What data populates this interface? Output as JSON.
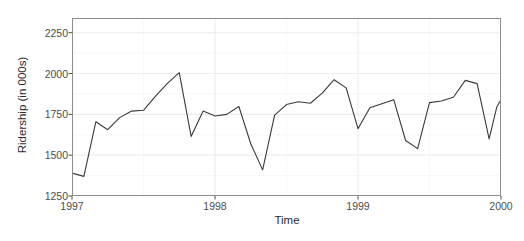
{
  "chart_data": {
    "type": "line",
    "title": "",
    "subtitle": "",
    "xlabel": "Time",
    "ylabel": "Ridership (in 000s)",
    "xlim": [
      1997.0,
      2000.0
    ],
    "ylim": [
      1250,
      2340
    ],
    "x_ticks": [
      1997,
      1998,
      1999,
      2000
    ],
    "x_tick_labels": [
      "1997",
      "1998",
      "1999",
      "2000"
    ],
    "y_ticks": [
      1250,
      1500,
      1750,
      2000,
      2250
    ],
    "y_tick_labels": [
      "1250",
      "1500",
      "1750",
      "2000",
      "2250"
    ],
    "grid": true,
    "minor_grid": true,
    "legend": "none",
    "line_color": "#3a3a3a",
    "panel_background": "#ffffff",
    "panel_border_color": "#808080",
    "grid_color": "#ededed",
    "series": [
      {
        "name": "Ridership",
        "x": [
          1997.0,
          1997.083,
          1997.167,
          1997.25,
          1997.333,
          1997.417,
          1997.5,
          1997.583,
          1997.667,
          1997.75,
          1997.833,
          1997.917,
          1998.0,
          1998.083,
          1998.167,
          1998.25,
          1998.333,
          1998.417,
          1998.5,
          1998.583,
          1998.667,
          1998.75,
          1998.833,
          1998.917,
          1999.0,
          1999.083,
          1999.167,
          1999.25,
          1999.333,
          1999.417,
          1999.5,
          1999.583,
          1999.667,
          1999.75,
          1999.833,
          1999.917
        ],
        "values": [
          1390,
          1370,
          1705,
          1656,
          1730,
          1770,
          1775,
          1860,
          1940,
          2005,
          1615,
          1700,
          1770,
          1740,
          1750,
          1798,
          1570,
          1410,
          1745,
          1810,
          1827,
          1818,
          1880,
          1962,
          1912,
          1662,
          1790,
          1815,
          1840,
          1590,
          1540,
          1822,
          1832,
          1855,
          1958,
          1938
        ],
        "tail_x": [
          1999.917,
          1999.95,
          1999.983
        ],
        "tail_values": [
          1938,
          1600,
          1793
        ]
      }
    ],
    "points_full": [
      {
        "t": "1997-01",
        "x": 1997.0,
        "y": 1390
      },
      {
        "t": "1997-02",
        "x": 1997.083,
        "y": 1370
      },
      {
        "t": "1997-03",
        "x": 1997.167,
        "y": 1705
      },
      {
        "t": "1997-04",
        "x": 1997.25,
        "y": 1656
      },
      {
        "t": "1997-05",
        "x": 1997.333,
        "y": 1730
      },
      {
        "t": "1997-06",
        "x": 1997.417,
        "y": 1770
      },
      {
        "t": "1997-07",
        "x": 1997.5,
        "y": 1775
      },
      {
        "t": "1997-08",
        "x": 1997.583,
        "y": 1860
      },
      {
        "t": "1997-09",
        "x": 1997.667,
        "y": 1940
      },
      {
        "t": "1997-10",
        "x": 1997.75,
        "y": 2005
      },
      {
        "t": "1997-11",
        "x": 1997.833,
        "y": 1615
      },
      {
        "t": "1997-12",
        "x": 1997.917,
        "y": 1770
      },
      {
        "t": "1998-01",
        "x": 1998.0,
        "y": 1740
      },
      {
        "t": "1998-02",
        "x": 1998.083,
        "y": 1750
      },
      {
        "t": "1998-03",
        "x": 1998.167,
        "y": 1798
      },
      {
        "t": "1998-04",
        "x": 1998.25,
        "y": 1570
      },
      {
        "t": "1998-05",
        "x": 1998.333,
        "y": 1410
      },
      {
        "t": "1998-06",
        "x": 1998.417,
        "y": 1745
      },
      {
        "t": "1998-07",
        "x": 1998.5,
        "y": 1810
      },
      {
        "t": "1998-08",
        "x": 1998.583,
        "y": 1827
      },
      {
        "t": "1998-09",
        "x": 1998.667,
        "y": 1818
      },
      {
        "t": "1998-10",
        "x": 1998.75,
        "y": 1880
      },
      {
        "t": "1998-11",
        "x": 1998.833,
        "y": 1962
      },
      {
        "t": "1998-12",
        "x": 1998.917,
        "y": 1912
      },
      {
        "t": "1999-01",
        "x": 1999.0,
        "y": 1662
      },
      {
        "t": "1999-02",
        "x": 1999.083,
        "y": 1790
      },
      {
        "t": "1999-03",
        "x": 1999.167,
        "y": 1815
      },
      {
        "t": "1999-04",
        "x": 1999.25,
        "y": 1840
      },
      {
        "t": "1999-05",
        "x": 1999.333,
        "y": 1590
      },
      {
        "t": "1999-06",
        "x": 1999.417,
        "y": 1540
      },
      {
        "t": "1999-07",
        "x": 1999.5,
        "y": 1822
      },
      {
        "t": "1999-08",
        "x": 1999.583,
        "y": 1832
      },
      {
        "t": "1999-09",
        "x": 1999.667,
        "y": 1855
      },
      {
        "t": "1999-10",
        "x": 1999.75,
        "y": 1958
      },
      {
        "t": "1999-11",
        "x": 1999.833,
        "y": 1938
      },
      {
        "t": "1999-12",
        "x": 1999.917,
        "y": 1600
      },
      {
        "t": "2000-01",
        "x": 1999.97,
        "y": 1793
      },
      {
        "t": "2000-02",
        "x": 1999.995,
        "y": 1830
      }
    ]
  }
}
